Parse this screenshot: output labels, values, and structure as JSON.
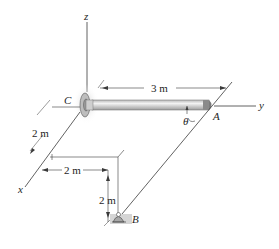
{
  "figure": {
    "axes": {
      "x": "x",
      "y": "y",
      "z": "z"
    },
    "points": {
      "A": "A",
      "B": "B",
      "C": "C"
    },
    "angle": "θ",
    "dimensions": {
      "rod_length": "3 m",
      "x_offset": "2 m",
      "y_offset": "2 m",
      "z_drop": "2 m"
    },
    "colors": {
      "line": "#3a3a3a",
      "rod_fill": "#c8c8c8",
      "rod_highlight": "#eeeeee",
      "shadow": "#d9d9d9"
    }
  }
}
